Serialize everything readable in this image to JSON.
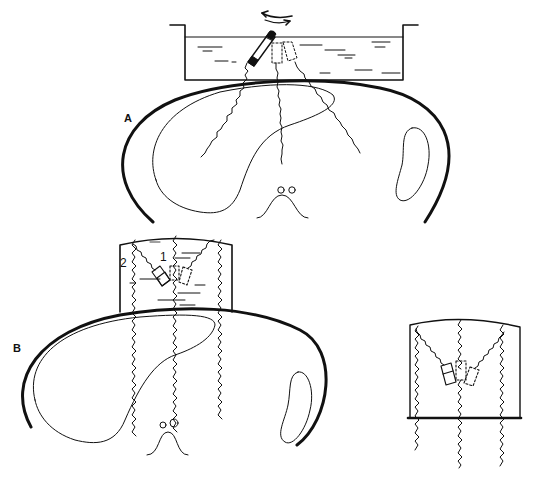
{
  "diagram": {
    "type": "ultrasound-scanning-technique-illustration",
    "colors": {
      "line": "#111111",
      "background": "#ffffff"
    },
    "panels": [
      {
        "id": "A",
        "label": "A",
        "description": "Water-bath tank with rotating transducer above transverse abdominal section",
        "elements": [
          "water-tank",
          "rotating-transducer",
          "rotation-arrow",
          "liver-outline",
          "kidney-outline",
          "spine-outline",
          "vessels",
          "wavy-sound-beams"
        ]
      },
      {
        "id": "B",
        "label": "B",
        "description": "Standoff block with multiple transducer positions above transverse abdominal section",
        "callouts": [
          {
            "id": "1",
            "text": "1"
          },
          {
            "id": "2",
            "text": "2"
          }
        ],
        "elements": [
          "standoff-block",
          "transducer-positions",
          "liver-outline",
          "kidney-outline",
          "spine-outline",
          "vessels",
          "wavy-sound-beams"
        ]
      },
      {
        "id": "B-detail",
        "label": "",
        "description": "Detail of standoff block with three transducer positions",
        "elements": [
          "standoff-block",
          "three-transducer-positions",
          "wavy-sound-beams"
        ]
      }
    ]
  }
}
